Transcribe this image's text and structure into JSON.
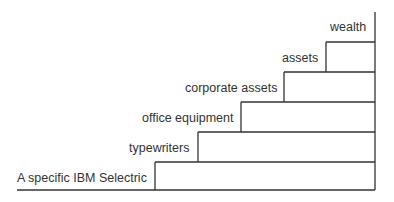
{
  "diagram": {
    "type": "staircase-abstraction-ladder",
    "line_color": "#333333",
    "steps": [
      {
        "label": "A specific IBM Selectric"
      },
      {
        "label": "typewriters"
      },
      {
        "label": "office equipment"
      },
      {
        "label": "corporate assets"
      },
      {
        "label": "assets"
      },
      {
        "label": "wealth"
      }
    ]
  }
}
